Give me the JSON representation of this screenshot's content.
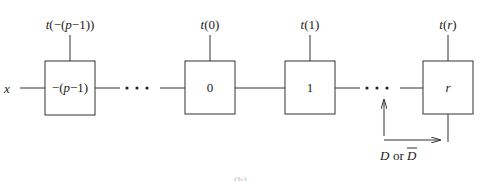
{
  "diagram": {
    "input_label": "x",
    "cells": [
      {
        "id": "cell-neg-p-minus-1",
        "inner_label": "−(p−1)",
        "top_label": "t(−(p−1))"
      },
      {
        "id": "cell-0",
        "inner_label": "0",
        "top_label": "t(0)"
      },
      {
        "id": "cell-1",
        "inner_label": "1",
        "top_label": "t(1)"
      },
      {
        "id": "cell-r",
        "inner_label": "r",
        "top_label": "t(r)"
      }
    ],
    "ellipsis": "• • •",
    "fault_label_prefix": "D",
    "fault_label_or": "or",
    "fault_label_bar": "D",
    "caption_fragment": "(b)"
  },
  "colors": {
    "line": "#333333",
    "text": "#222222",
    "background": "#ffffff"
  }
}
